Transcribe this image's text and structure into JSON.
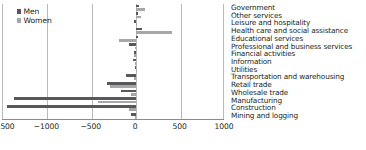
{
  "chart_data": {
    "type": "bar",
    "orientation": "horizontal",
    "title": "",
    "xlabel": "",
    "ylabel": "",
    "xlim": [
      -1500,
      1000
    ],
    "xticks": [
      -1500,
      -1000,
      -500,
      0,
      500,
      1000
    ],
    "xtick_labels": [
      "−1500",
      "−1000",
      "−500",
      "0",
      "500",
      "1000"
    ],
    "grid": true,
    "legend_position": "top-left",
    "categories": [
      "Government",
      "Other services",
      "Leisure and hospitality",
      "Health care and social assistance",
      "Educational services",
      "Professional and business services",
      "Financial activities",
      "Information",
      "Utilities",
      "Transportation and warehousing",
      "Retail trade",
      "Wholesale trade",
      "Manufacturing",
      "Construction",
      "Mining and logging"
    ],
    "series": [
      {
        "name": "Men",
        "color": "#58585a",
        "values": [
          30,
          25,
          -30,
          60,
          20,
          -80,
          -30,
          -40,
          -10,
          -110,
          -330,
          -170,
          -1380,
          -1450,
          -60
        ]
      },
      {
        "name": "Women",
        "color": "#a7a7a9",
        "values": [
          95,
          55,
          10,
          400,
          -195,
          -10,
          -25,
          -15,
          -3,
          -30,
          -290,
          -55,
          -430,
          -80,
          -8
        ]
      }
    ]
  },
  "legend": {
    "items": [
      {
        "label": "Men",
        "color": "#58585a"
      },
      {
        "label": "Women",
        "color": "#a7a7a9"
      }
    ]
  }
}
